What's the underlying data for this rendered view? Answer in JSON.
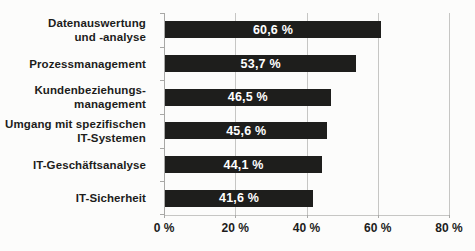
{
  "chart_data": {
    "type": "bar",
    "orientation": "horizontal",
    "title": "",
    "xlabel": "",
    "ylabel": "",
    "xlim": [
      0,
      80
    ],
    "grid": "vertical",
    "legend": "none",
    "categories": [
      "Datenauswertung und -analyse",
      "Prozessmanagement",
      "Kundenbeziehungs-management",
      "Umgang mit spezifischen IT-Systemen",
      "IT-Geschäftsanalyse",
      "IT-Sicherheit"
    ],
    "category_lines": [
      [
        "Datenauswertung",
        "und -analyse"
      ],
      [
        "Prozessmanagement"
      ],
      [
        "Kundenbeziehungs-",
        "management"
      ],
      [
        "Umgang mit spezifischen",
        "IT-Systemen"
      ],
      [
        "IT-Geschäftsanalyse"
      ],
      [
        "IT-Sicherheit"
      ]
    ],
    "values": [
      60.6,
      53.7,
      46.5,
      45.6,
      44.1,
      41.6
    ],
    "value_labels": [
      "60,6 %",
      "53,7 %",
      "46,5 %",
      "45,6 %",
      "44,1 %",
      "41,6 %"
    ],
    "x_tick_values": [
      0,
      20,
      40,
      60,
      80
    ],
    "x_tick_labels": [
      "0 %",
      "20 %",
      "40 %",
      "60 %",
      "80 %"
    ],
    "colors": {
      "bar": "#1e1e1c",
      "value_text": "#ffffff",
      "label_text": "#1d1d1b",
      "grid": "#c6c6c4",
      "axis": "#a8a8a6",
      "background": "#fcfcfb"
    }
  }
}
